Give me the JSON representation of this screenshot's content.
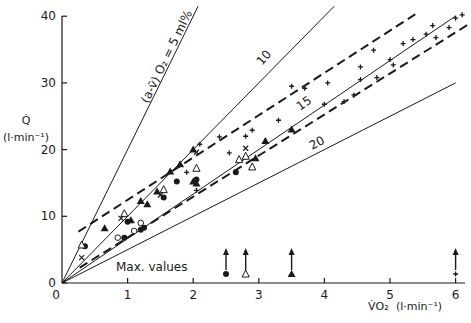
{
  "chart_data": {
    "type": "scatter",
    "title": "",
    "xlabel": "V̇O2 (l·min⁻¹)",
    "ylabel": "Q̇ (l·min⁻¹)",
    "xlim": [
      0,
      6
    ],
    "ylim": [
      0,
      40
    ],
    "x_ticks": [
      0,
      1,
      2,
      3,
      4,
      5,
      6
    ],
    "y_ticks": [
      0,
      10,
      20,
      30,
      40
    ],
    "x_tick_labels": [
      "0",
      "1",
      "2",
      "3",
      "4",
      "5",
      "6"
    ],
    "y_tick_labels": [
      "0",
      "10",
      "20",
      "30",
      "40"
    ],
    "grid": false,
    "legend": "none",
    "iso_lines": [
      {
        "label": "(a-v̄) O2 = 5 ml%",
        "avdo2": 5,
        "slope": 20,
        "style": "solid"
      },
      {
        "label": "10",
        "avdo2": 10,
        "slope": 10,
        "style": "solid"
      },
      {
        "label": "15",
        "avdo2": 15,
        "slope": 6.67,
        "style": "solid"
      },
      {
        "label": "20",
        "avdo2": 20,
        "slope": 5,
        "style": "solid"
      }
    ],
    "confidence_band": {
      "style": "dashed",
      "upper": [
        [
          0.25,
          7.7
        ],
        [
          5.45,
          40.7
        ]
      ],
      "lower": [
        [
          0.27,
          2.3
        ],
        [
          6.2,
          38.8
        ]
      ]
    },
    "series": [
      {
        "name": "filled-circle",
        "marker": "●",
        "points": [
          [
            0.35,
            5.5
          ],
          [
            0.95,
            6.8
          ],
          [
            1.0,
            9.2
          ],
          [
            1.2,
            8.0
          ],
          [
            1.25,
            8.3
          ],
          [
            1.55,
            12.8
          ],
          [
            1.75,
            15.2
          ],
          [
            2.05,
            15.5
          ],
          [
            2.65,
            16.6
          ]
        ]
      },
      {
        "name": "open-circle",
        "marker": "○",
        "points": [
          [
            0.85,
            6.8
          ],
          [
            1.1,
            7.8
          ],
          [
            1.2,
            9.0
          ]
        ]
      },
      {
        "name": "filled-triangle",
        "marker": "▲",
        "points": [
          [
            0.65,
            8.2
          ],
          [
            1.05,
            9.4
          ],
          [
            1.2,
            12.3
          ],
          [
            1.3,
            11.8
          ],
          [
            1.45,
            13.7
          ],
          [
            1.65,
            16.7
          ],
          [
            1.8,
            17.8
          ],
          [
            2.0,
            15.2
          ],
          [
            2.05,
            14.9
          ],
          [
            2.0,
            20.0
          ],
          [
            2.95,
            18.7
          ],
          [
            3.1,
            21.3
          ],
          [
            3.5,
            23.0
          ]
        ]
      },
      {
        "name": "open-triangle",
        "marker": "△",
        "points": [
          [
            0.3,
            5.7
          ],
          [
            0.95,
            10.4
          ],
          [
            1.55,
            14.0
          ],
          [
            2.05,
            17.2
          ],
          [
            2.7,
            18.5
          ],
          [
            2.8,
            19.0
          ],
          [
            2.9,
            17.4
          ]
        ]
      },
      {
        "name": "cross",
        "marker": "×",
        "points": [
          [
            0.3,
            3.8
          ],
          [
            0.9,
            9.7
          ],
          [
            1.5,
            13.2
          ],
          [
            2.05,
            19.6
          ],
          [
            2.8,
            20.2
          ]
        ]
      },
      {
        "name": "plus",
        "marker": "+",
        "points": [
          [
            1.9,
            16.6
          ],
          [
            2.05,
            13.9
          ],
          [
            2.1,
            20.8
          ],
          [
            2.4,
            21.9
          ],
          [
            2.55,
            19.5
          ],
          [
            2.8,
            22.0
          ],
          [
            2.9,
            22.9
          ],
          [
            3.3,
            24.4
          ],
          [
            3.5,
            29.5
          ],
          [
            3.7,
            29.2
          ],
          [
            4.0,
            26.8
          ],
          [
            4.05,
            30.0
          ],
          [
            4.3,
            27.2
          ],
          [
            4.45,
            28.2
          ],
          [
            4.55,
            32.4
          ],
          [
            4.55,
            30.5
          ],
          [
            4.75,
            34.9
          ],
          [
            4.8,
            30.8
          ],
          [
            5.0,
            33.5
          ],
          [
            5.05,
            32.7
          ],
          [
            5.2,
            35.9
          ],
          [
            5.35,
            36.5
          ],
          [
            5.55,
            37.3
          ],
          [
            5.65,
            38.6
          ],
          [
            5.7,
            36.8
          ],
          [
            5.9,
            38.3
          ],
          [
            6.0,
            39.7
          ],
          [
            6.1,
            40.2
          ]
        ]
      }
    ],
    "max_values": {
      "label": "Max. values",
      "markers": [
        {
          "marker": "filled-circle",
          "vo2": 2.5
        },
        {
          "marker": "open-triangle",
          "vo2": 2.8
        },
        {
          "marker": "filled-triangle",
          "vo2": 3.5
        },
        {
          "marker": "plus",
          "vo2": 6.0
        }
      ]
    },
    "annotations": [
      "(a-v̄) O2 = 5 ml%",
      "10",
      "15",
      "20",
      "Max. values"
    ]
  },
  "labels": {
    "y_axis_symbol": "Q̇",
    "y_axis_unit": "(l·min⁻¹)",
    "x_axis_symbol": "V̇O₂",
    "x_axis_unit": "(l·min⁻¹)",
    "max_values": "Max. values",
    "iso_5": "(a-v̄) O₂ = 5 ml%",
    "iso_10": "10",
    "iso_15": "15",
    "iso_20": "20"
  }
}
